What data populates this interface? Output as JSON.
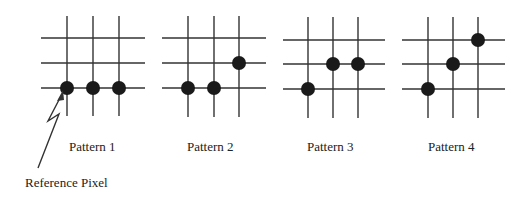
{
  "patterns": [
    {
      "label": "Pattern 1",
      "dots": [
        [
          0,
          2
        ],
        [
          1,
          2
        ],
        [
          2,
          2
        ]
      ]
    },
    {
      "label": "Pattern 2",
      "dots": [
        [
          0,
          2
        ],
        [
          1,
          2
        ],
        [
          2,
          1
        ]
      ]
    },
    {
      "label": "Pattern 3",
      "dots": [
        [
          0,
          2
        ],
        [
          1,
          1
        ],
        [
          2,
          1
        ]
      ]
    },
    {
      "label": "Pattern 4",
      "dots": [
        [
          0,
          2
        ],
        [
          1,
          1
        ],
        [
          2,
          0
        ]
      ]
    }
  ],
  "annotation": {
    "label": "Reference Pixel"
  },
  "colors": {
    "line": "#333333",
    "dot": "#1a1a1a"
  }
}
